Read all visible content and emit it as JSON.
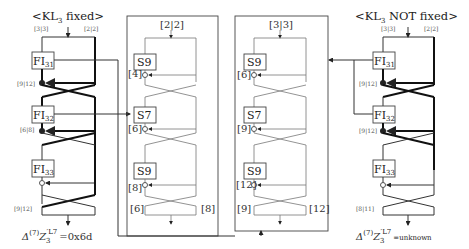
{
  "left": {
    "title": "<KL3 fixed>",
    "title_parts": {
      "pre": "<KL",
      "sub": "3",
      "post": " fixed>"
    },
    "top_labels": [
      "[3|3]",
      "[2|2]"
    ],
    "fi_boxes": [
      {
        "name": "FI",
        "sub": "31",
        "diff": "[9|12]"
      },
      {
        "name": "FI",
        "sub": "32",
        "diff": "[6|8]"
      },
      {
        "name": "FI",
        "sub": "33",
        "diff": ""
      }
    ],
    "bottom_label": "[9|12]",
    "result": {
      "delta": "Δ",
      "sup": "(7)",
      "z": "Z",
      "zsub": "3",
      "zsup": "′L7",
      "value": "=0x6d"
    }
  },
  "middle_left": {
    "top_label": "[2|2]",
    "s_boxes": [
      {
        "name": "S9",
        "diff": "[4]"
      },
      {
        "name": "S7",
        "diff": "[6]"
      },
      {
        "name": "S9",
        "diff": "[8]"
      }
    ],
    "bottom_labels": [
      "[6]",
      "[8]"
    ]
  },
  "middle_right": {
    "top_label": "[3|3]",
    "s_boxes": [
      {
        "name": "S9",
        "diff": "[6]"
      },
      {
        "name": "S7",
        "diff": "[9]"
      },
      {
        "name": "S9",
        "diff": "[12]"
      }
    ],
    "bottom_labels": [
      "[9]",
      "[12]"
    ]
  },
  "right": {
    "title": "<KL3 NOT fixed>",
    "title_parts": {
      "pre": "<KL",
      "sub": "3",
      "post": " NOT fixed>"
    },
    "top_labels": [
      "[3|3]",
      "[2|2]"
    ],
    "fi_boxes": [
      {
        "name": "FI",
        "sub": "31",
        "diff": "[9|12]"
      },
      {
        "name": "FI",
        "sub": "32",
        "diff": "[9|12]"
      },
      {
        "name": "FI",
        "sub": "33",
        "diff": ""
      }
    ],
    "bottom_label": "[8|11]",
    "result": {
      "delta": "Δ",
      "sup": "(7)",
      "z": "Z",
      "zsub": "3",
      "zsup": "′L7",
      "value": "=unknown"
    }
  },
  "colors": {
    "line": "#333333",
    "thick": "#111111",
    "box_border": "#444444",
    "label": "#555555"
  }
}
